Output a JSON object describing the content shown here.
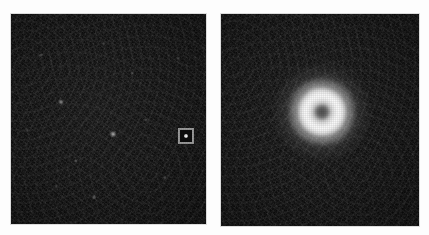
{
  "figure": {
    "width": 429,
    "height": 235,
    "background_color": "#fdfdfd",
    "layout": "two-panel-horizontal",
    "caption": "",
    "title": ""
  },
  "panels": [
    {
      "id": "panel-wide-field",
      "role": "wide-field-survey-image",
      "label": "",
      "x": 11,
      "y": 14,
      "width": 195,
      "height": 210,
      "background_color": "#0a0a0a",
      "colormap": "grayscale-linear",
      "description": "wide field dark sky frame with faint point sources and a square marker box",
      "marker_box": {
        "id": "source-marker-box",
        "center_x": 186,
        "center_y": 136,
        "size": 16,
        "border_color": "#9a9a9a",
        "border_width": 2,
        "inner_color": "#0d0d0d",
        "core_color": "#ffffff"
      },
      "point_sources": [
        {
          "x": 61,
          "y": 102,
          "radius": 3.0,
          "brightness": 0.55
        },
        {
          "x": 113,
          "y": 134,
          "radius": 3.4,
          "brightness": 0.7
        },
        {
          "x": 76,
          "y": 161,
          "radius": 2.2,
          "brightness": 0.32
        },
        {
          "x": 146,
          "y": 120,
          "radius": 2.0,
          "brightness": 0.26
        },
        {
          "x": 41,
          "y": 55,
          "radius": 2.0,
          "brightness": 0.24
        },
        {
          "x": 165,
          "y": 178,
          "radius": 2.2,
          "brightness": 0.3
        },
        {
          "x": 94,
          "y": 197,
          "radius": 2.4,
          "brightness": 0.34
        },
        {
          "x": 132,
          "y": 73,
          "radius": 1.9,
          "brightness": 0.22
        },
        {
          "x": 56,
          "y": 186,
          "radius": 1.8,
          "brightness": 0.2
        },
        {
          "x": 178,
          "y": 58,
          "radius": 1.8,
          "brightness": 0.2
        },
        {
          "x": 27,
          "y": 130,
          "radius": 1.8,
          "brightness": 0.18
        },
        {
          "x": 104,
          "y": 44,
          "radius": 1.7,
          "brightness": 0.18
        }
      ]
    },
    {
      "id": "panel-zoom",
      "role": "zoomed-cutout-image",
      "label": "",
      "x": 221,
      "y": 14,
      "width": 198,
      "height": 212,
      "background_color": "#0a0a0a",
      "colormap": "grayscale-linear",
      "description": "zoomed cutout of the marked source showing a bright annular ring with a darker central depression",
      "ring_source": {
        "id": "annular-source",
        "center_x": 322,
        "center_y": 112,
        "halo_diameter": 96,
        "shoulder_diameter": 66,
        "annulus_diameter": 48,
        "core_dip_diameter": 15,
        "peak_color": "#ffffff",
        "core_color": "#606060",
        "knots": [
          {
            "x": 316,
            "y": 96,
            "size": 20,
            "brightness": 0.55
          },
          {
            "x": 335,
            "y": 120,
            "size": 16,
            "brightness": 0.38
          },
          {
            "x": 308,
            "y": 124,
            "size": 15,
            "brightness": 0.34
          }
        ]
      }
    }
  ]
}
